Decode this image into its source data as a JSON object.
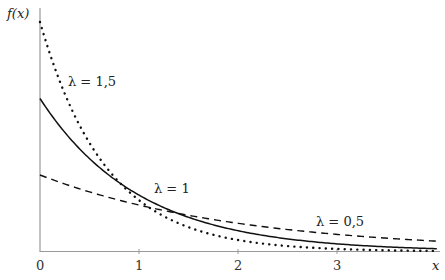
{
  "chart_data": {
    "type": "line",
    "title": "",
    "xlabel": "x",
    "ylabel": "f(x)",
    "xlim": [
      0,
      4
    ],
    "ylim": [
      0,
      1.5
    ],
    "x_ticks": [
      "0",
      "1",
      "2",
      "3"
    ],
    "grid": false,
    "legend": "inline annotations",
    "function": "f(x) = λ·e^(−λx)",
    "series": [
      {
        "name": "λ = 1,5",
        "lambda": 1.5,
        "style": "dotted",
        "x": [
          0,
          0.5,
          1,
          1.5,
          2,
          2.5,
          3,
          3.5,
          4
        ],
        "values": [
          1.5,
          0.709,
          0.335,
          0.158,
          0.075,
          0.035,
          0.017,
          0.008,
          0.004
        ]
      },
      {
        "name": "λ = 1",
        "lambda": 1,
        "style": "solid",
        "x": [
          0,
          0.5,
          1,
          1.5,
          2,
          2.5,
          3,
          3.5,
          4
        ],
        "values": [
          1.0,
          0.607,
          0.368,
          0.223,
          0.135,
          0.082,
          0.05,
          0.03,
          0.018
        ]
      },
      {
        "name": "λ = 0,5",
        "lambda": 0.5,
        "style": "dashed",
        "x": [
          0,
          0.5,
          1,
          1.5,
          2,
          2.5,
          3,
          3.5,
          4
        ],
        "values": [
          0.5,
          0.389,
          0.303,
          0.236,
          0.184,
          0.143,
          0.112,
          0.087,
          0.068
        ]
      }
    ],
    "annotations": [
      {
        "text": "λ = 1,5",
        "x": 0.28,
        "y": 1.1
      },
      {
        "text": "λ = 1",
        "x": 1.15,
        "y": 0.4
      },
      {
        "text": "λ = 0,5",
        "x": 2.8,
        "y": 0.19
      }
    ]
  },
  "labels": {
    "ylabel": "f(x)",
    "xlabel": "x",
    "tick0": "0",
    "tick1": "1",
    "tick2": "2",
    "tick3": "3",
    "ann_15": "λ = 1,5",
    "ann_1": "λ = 1",
    "ann_05": "λ = 0,5"
  }
}
